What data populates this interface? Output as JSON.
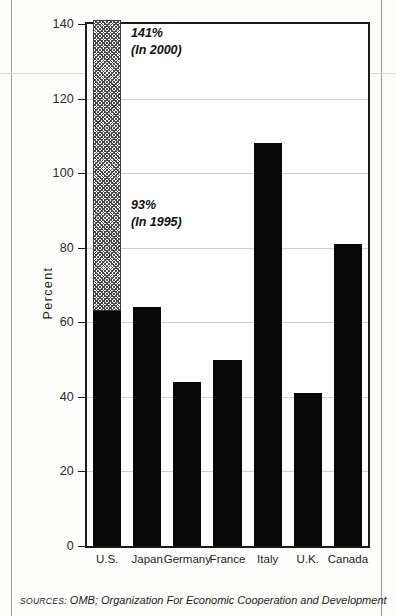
{
  "chart_data": {
    "type": "bar",
    "title": "",
    "subtitle": "",
    "xlabel": "",
    "ylabel": "Percent",
    "ylim": [
      0,
      140
    ],
    "yticks": [
      0,
      20,
      40,
      60,
      80,
      100,
      120,
      140
    ],
    "ytick_labels": [
      "0",
      "20",
      "40",
      "60",
      "80",
      "100",
      "120",
      "140"
    ],
    "grid": true,
    "legend": "none",
    "categories": [
      "U.S.",
      "Japan",
      "Germany",
      "France",
      "Italy",
      "U.K.",
      "Canada"
    ],
    "values": [
      63,
      64,
      44,
      50,
      108,
      41,
      81
    ],
    "series": [
      {
        "name": "In 1995",
        "style": "solid-black",
        "values": [
          63,
          64,
          44,
          50,
          108,
          41,
          81
        ]
      },
      {
        "name": "In 2000 (projected, U.S. only)",
        "style": "hatched",
        "values": [
          141,
          null,
          null,
          null,
          null,
          null,
          null
        ]
      }
    ],
    "annotations": [
      {
        "id": "annotation-2000",
        "text": "141%\n(In 2000)",
        "value": 141,
        "target_category": "U.S."
      },
      {
        "id": "annotation-1995",
        "text": "93%\n(In 1995)",
        "value": 93,
        "target_category": "U.S."
      }
    ],
    "source_prefix": "SOURCES:",
    "source_text": "OMB; Organization For Economic Cooperation and Development",
    "colors": {
      "bar_solid": "#070707",
      "bar_hatch_line": "#4a4a4a",
      "axis": "#1c1c1c",
      "gridline": "#cfcfcb",
      "background": "#ffffff"
    }
  }
}
